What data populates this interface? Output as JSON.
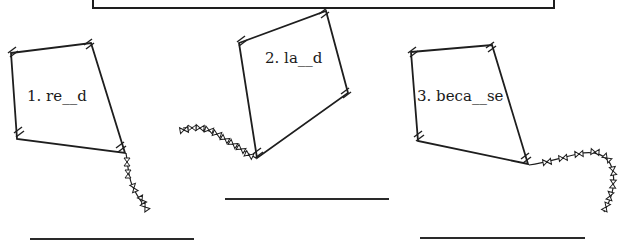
{
  "word_box": {
    "visible": "bottom edge only (content cropped off top)"
  },
  "kites": [
    {
      "number": "1.",
      "word": "re__d",
      "label": "1. re__d",
      "vertices": [
        [
          11,
          53
        ],
        [
          91,
          43
        ],
        [
          125,
          153
        ],
        [
          17,
          139
        ]
      ],
      "label_pos": [
        27,
        89
      ],
      "tail": "down-right"
    },
    {
      "number": "2.",
      "word": "la__d",
      "label": "2. la__d",
      "vertices": [
        [
          239,
          43
        ],
        [
          326,
          11
        ],
        [
          348,
          93
        ],
        [
          257,
          158
        ]
      ],
      "label_pos": [
        265,
        51
      ],
      "tail": "left"
    },
    {
      "number": "3.",
      "word": "beca__se",
      "label": "3. beca__se",
      "vertices": [
        [
          411,
          52
        ],
        [
          492,
          45
        ],
        [
          528,
          164
        ],
        [
          418,
          141
        ]
      ],
      "label_pos": [
        417,
        89
      ],
      "tail": "right-then-down"
    }
  ],
  "answer_lines": [
    {
      "for": "1",
      "x1": 30,
      "x2": 194,
      "y": 239
    },
    {
      "for": "2",
      "x1": 225,
      "x2": 389,
      "y": 199
    },
    {
      "for": "3",
      "x1": 420,
      "x2": 585,
      "y": 238
    }
  ],
  "colors": {
    "ink": "#1e1e1e",
    "paper": "#ffffff"
  }
}
